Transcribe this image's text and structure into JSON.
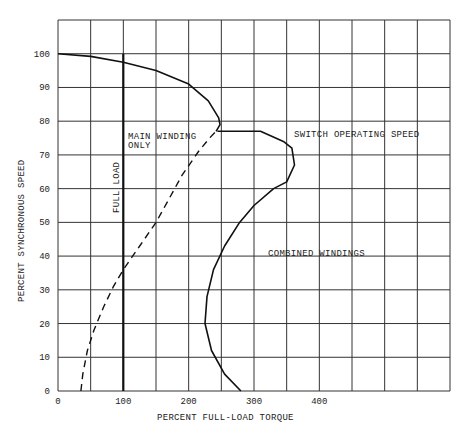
{
  "chart_data": {
    "type": "line",
    "title": "",
    "xlabel": "PERCENT FULL-LOAD TORQUE",
    "ylabel": "PERCENT SYNCHRONOUS SPEED",
    "xlim": [
      0,
      600
    ],
    "ylim": [
      0,
      110
    ],
    "x_ticks": [
      0,
      100,
      200,
      300,
      400
    ],
    "y_ticks": [
      0,
      10,
      20,
      30,
      40,
      50,
      60,
      70,
      80,
      90,
      100
    ],
    "grid": true,
    "grid_x_step": 50,
    "grid_y_step": 10,
    "series": [
      {
        "name": "Main winding only (running)",
        "style": "solid",
        "points": [
          [
            0,
            100
          ],
          [
            50,
            99.2
          ],
          [
            100,
            97.5
          ],
          [
            150,
            95
          ],
          [
            200,
            91
          ],
          [
            230,
            86
          ],
          [
            246,
            81
          ],
          [
            248,
            79
          ],
          [
            242,
            77
          ]
        ]
      },
      {
        "name": "Main winding only (starting)",
        "style": "dashed",
        "points": [
          [
            35,
            0
          ],
          [
            38,
            5
          ],
          [
            45,
            12
          ],
          [
            55,
            18
          ],
          [
            70,
            25
          ],
          [
            85,
            31
          ],
          [
            100,
            36
          ],
          [
            125,
            43
          ],
          [
            150,
            50
          ],
          [
            170,
            57
          ],
          [
            190,
            64
          ],
          [
            215,
            71
          ],
          [
            232,
            75
          ],
          [
            242,
            77
          ]
        ]
      },
      {
        "name": "Combined windings",
        "style": "solid",
        "points": [
          [
            280,
            0
          ],
          [
            255,
            5
          ],
          [
            235,
            12
          ],
          [
            225,
            20
          ],
          [
            228,
            28
          ],
          [
            238,
            36
          ],
          [
            255,
            43
          ],
          [
            278,
            50
          ],
          [
            300,
            55
          ],
          [
            330,
            60
          ],
          [
            350,
            62
          ],
          [
            362,
            67
          ],
          [
            358,
            72
          ],
          [
            345,
            74
          ],
          [
            310,
            77
          ],
          [
            244,
            77
          ]
        ]
      },
      {
        "name": "Full load",
        "style": "solid-thick",
        "points": [
          [
            100,
            0
          ],
          [
            100,
            100
          ]
        ]
      }
    ],
    "annotations": [
      {
        "text": "MAIN WINDING",
        "x": 140,
        "y": 75
      },
      {
        "text": "ONLY",
        "x": 140,
        "y": 72
      },
      {
        "text": "FULL LOAD",
        "x": 85,
        "y": 60,
        "rotation": -90
      },
      {
        "text": "SWITCH OPERATING SPEED",
        "x": 360,
        "y": 76
      },
      {
        "text": "COMBINED WINDINGS",
        "x": 320,
        "y": 40
      }
    ]
  },
  "labels": {
    "xlabel": "PERCENT FULL-LOAD TORQUE",
    "ylabel": "PERCENT SYNCHRONOUS SPEED",
    "main_winding_1": "MAIN WINDING",
    "main_winding_2": "ONLY",
    "full_load": "FULL LOAD",
    "switch_speed": "SWITCH OPERATING SPEED",
    "combined": "COMBINED WINDINGS"
  },
  "ticks": {
    "x": [
      "0",
      "100",
      "200",
      "300",
      "400"
    ],
    "y": [
      "0",
      "10",
      "20",
      "30",
      "40",
      "50",
      "60",
      "70",
      "80",
      "90",
      "100"
    ]
  }
}
